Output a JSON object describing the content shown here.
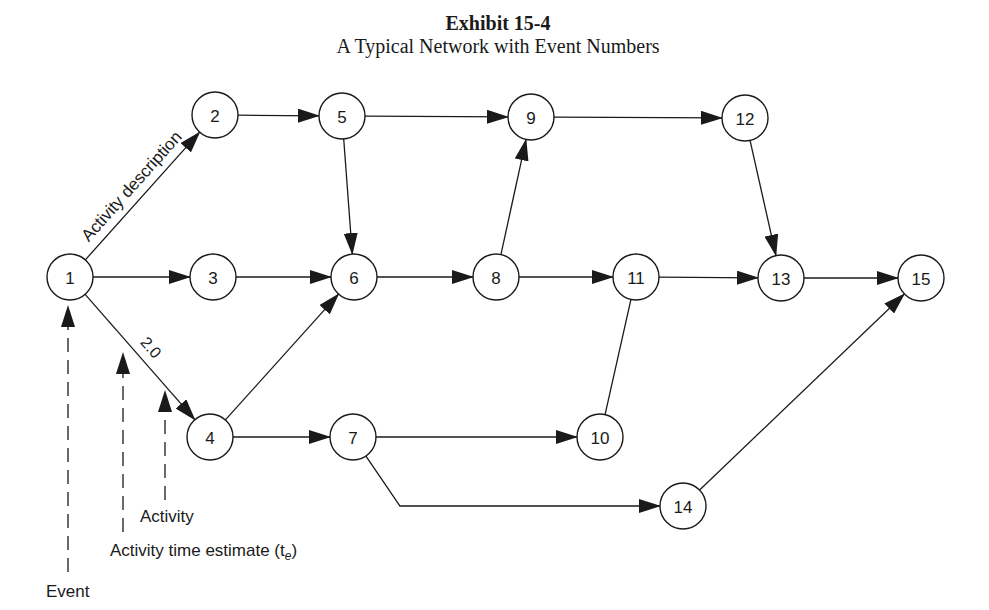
{
  "title": {
    "exhibit": "Exhibit 15-4",
    "subtitle": "A Typical Network with Event Numbers"
  },
  "colors": {
    "ink": "#1a1a1a",
    "background": "#ffffff"
  },
  "diagram": {
    "node_radius": 23,
    "nodes": [
      {
        "id": "1",
        "x": 70,
        "y": 277
      },
      {
        "id": "2",
        "x": 215,
        "y": 115
      },
      {
        "id": "3",
        "x": 213,
        "y": 277
      },
      {
        "id": "4",
        "x": 210,
        "y": 437
      },
      {
        "id": "5",
        "x": 342,
        "y": 116
      },
      {
        "id": "6",
        "x": 354,
        "y": 277
      },
      {
        "id": "7",
        "x": 353,
        "y": 437
      },
      {
        "id": "8",
        "x": 496,
        "y": 277
      },
      {
        "id": "9",
        "x": 531,
        "y": 117
      },
      {
        "id": "10",
        "x": 600,
        "y": 437
      },
      {
        "id": "11",
        "x": 636,
        "y": 277
      },
      {
        "id": "12",
        "x": 745,
        "y": 118
      },
      {
        "id": "13",
        "x": 781,
        "y": 278
      },
      {
        "id": "14",
        "x": 683,
        "y": 506
      },
      {
        "id": "15",
        "x": 921,
        "y": 278
      }
    ],
    "edges": [
      {
        "from": "1",
        "to": "2",
        "arrow": true,
        "label": "Activity description"
      },
      {
        "from": "1",
        "to": "3",
        "arrow": true
      },
      {
        "from": "1",
        "to": "4",
        "arrow": true,
        "label": "2.0"
      },
      {
        "from": "2",
        "to": "5",
        "arrow": true
      },
      {
        "from": "3",
        "to": "6",
        "arrow": true
      },
      {
        "from": "4",
        "to": "6",
        "arrow": true
      },
      {
        "from": "4",
        "to": "7",
        "arrow": true
      },
      {
        "from": "5",
        "to": "9",
        "arrow": true
      },
      {
        "from": "5",
        "to": "6",
        "arrow": true
      },
      {
        "from": "6",
        "to": "8",
        "arrow": true
      },
      {
        "from": "8",
        "to": "9",
        "arrow": true
      },
      {
        "from": "8",
        "to": "11",
        "arrow": true
      },
      {
        "from": "9",
        "to": "12",
        "arrow": true
      },
      {
        "from": "12",
        "to": "13",
        "arrow": true
      },
      {
        "from": "11",
        "to": "13",
        "arrow": true
      },
      {
        "from": "13",
        "to": "15",
        "arrow": true
      },
      {
        "from": "7",
        "to": "10",
        "arrow": true
      },
      {
        "from": "10",
        "to": "11",
        "arrow": false
      },
      {
        "from": "7",
        "to": "14",
        "arrow": true,
        "via": [
          [
            400,
            506
          ]
        ]
      },
      {
        "from": "14",
        "to": "15",
        "arrow": true
      }
    ],
    "callouts": [
      {
        "label": "Event",
        "x": 68,
        "line_top": 305,
        "line_bottom": 572,
        "text_x": 46,
        "text_y": 597
      },
      {
        "label": "Activity time estimate (t",
        "subscript": "e",
        "suffix": ")",
        "x": 123,
        "line_top": 352,
        "line_bottom": 532,
        "text_x": 110,
        "text_y": 556
      },
      {
        "label": "Activity",
        "x": 165,
        "line_top": 390,
        "line_bottom": 500,
        "text_x": 140,
        "text_y": 522
      }
    ]
  }
}
